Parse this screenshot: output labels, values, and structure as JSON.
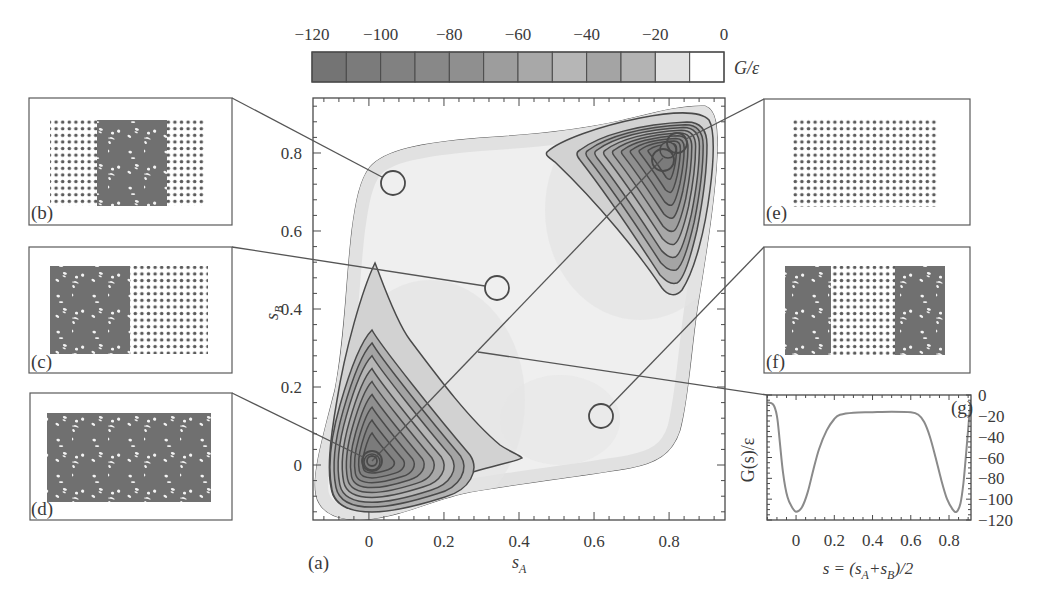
{
  "figure": {
    "panel_a_label": "(a)",
    "main_xlabel": {
      "base": "s",
      "sub": "A"
    },
    "main_ylabel": {
      "base": "s",
      "sub": "B"
    },
    "colorbar_label": "G/ε",
    "insets": [
      {
        "id": "b",
        "label": "(b)",
        "pattern": "crystal-with-disordered-center"
      },
      {
        "id": "c",
        "label": "(c)",
        "pattern": "disordered-left-crystal-right"
      },
      {
        "id": "d",
        "label": "(d)",
        "pattern": "fully-disordered"
      },
      {
        "id": "e",
        "label": "(e)",
        "pattern": "fully-crystalline"
      },
      {
        "id": "f",
        "label": "(f)",
        "pattern": "disordered-crystal-disordered"
      }
    ],
    "g_label": "(g)",
    "g_ylabel": "G(s)/ε",
    "g_xlabel_parts": [
      {
        "t": "s = (s"
      },
      {
        "t": "A",
        "sub": true
      },
      {
        "t": "+s"
      },
      {
        "t": "B",
        "sub": true
      },
      {
        "t": ")/2"
      }
    ]
  },
  "chart_data": [
    {
      "type": "heatmap",
      "subtype": "contour",
      "panel": "(a)",
      "title": "",
      "xlabel": "s_A",
      "ylabel": "s_B",
      "xlim": [
        -0.149,
        0.949
      ],
      "ylim": [
        -0.141,
        0.941
      ],
      "xticks": [
        0,
        0.2,
        0.4,
        0.6,
        0.8
      ],
      "xtick_labels": [
        "0",
        "0.2",
        "0.4",
        "0.6",
        "0.8"
      ],
      "yticks": [
        0,
        0.2,
        0.4,
        0.6,
        0.8
      ],
      "ytick_labels": [
        "0",
        "0.2",
        "0.4",
        "0.6",
        "0.8"
      ],
      "minor_tick_step": 0.04,
      "grid": false,
      "contour_levels": [
        -10,
        -20,
        -30,
        -40,
        -50,
        -60,
        -70,
        -80,
        -90,
        -100,
        -110
      ],
      "minima": [
        {
          "s_A": 0.0,
          "s_B": 0.0,
          "G": -115
        },
        {
          "s_A": 0.8,
          "s_B": 0.8,
          "G": -115
        }
      ],
      "markers": [
        {
          "inset": "(b)",
          "s_A": 0.06,
          "s_B": 0.72
        },
        {
          "inset": "(c)",
          "s_A": 0.34,
          "s_B": 0.45
        },
        {
          "inset": "(d)",
          "s_A": 0.01,
          "s_B": 0.01
        },
        {
          "inset": "(e)",
          "s_A": 0.82,
          "s_B": 0.83
        },
        {
          "inset": "(e)",
          "s_A": 0.78,
          "s_B": 0.78
        },
        {
          "inset": "(f)",
          "s_A": 0.62,
          "s_B": 0.13
        }
      ],
      "path_line": {
        "inset": "(g)",
        "from": [
          0.0,
          0.0
        ],
        "to": [
          0.78,
          0.78
        ]
      },
      "colorbar": {
        "label": "G/ε",
        "range": [
          -120,
          0
        ],
        "step": 10,
        "ticks": [
          -120,
          -100,
          -80,
          -60,
          -40,
          -20,
          0
        ],
        "tick_labels": [
          "−120",
          "−100",
          "−80",
          "−60",
          "−40",
          "−20",
          "0"
        ],
        "colors": [
          "#747474",
          "#7b7b7b",
          "#818181",
          "#888888",
          "#8f8f8f",
          "#9d9d9d",
          "#a8a8a8",
          "#b6b6b6",
          "#a4a4a4",
          "#b3b3b3",
          "#e2e2e2",
          "#ffffff"
        ]
      }
    },
    {
      "type": "line",
      "panel": "(g)",
      "title": "",
      "xlabel": "s = (s_A+s_B)/2",
      "ylabel": "G(s)/ε",
      "xlim": [
        -0.152,
        0.915
      ],
      "ylim": [
        -120,
        0
      ],
      "xticks": [
        0,
        0.2,
        0.4,
        0.6,
        0.8
      ],
      "xtick_labels": [
        "0",
        "0.2",
        "0.4",
        "0.6",
        "0.8"
      ],
      "yticks": [
        0,
        -20,
        -40,
        -60,
        -80,
        -100,
        -120
      ],
      "ytick_labels": [
        "0",
        "−20",
        "−40",
        "−60",
        "−80",
        "−100",
        "−120"
      ],
      "grid": false,
      "series": [
        {
          "name": "G(s)",
          "x": [
            -0.15,
            -0.12,
            -0.1,
            -0.085,
            -0.068,
            -0.045,
            -0.02,
            0,
            0.03,
            0.06,
            0.09,
            0.12,
            0.16,
            0.2,
            0.23,
            0.3,
            0.4,
            0.5,
            0.6,
            0.64,
            0.67,
            0.7,
            0.73,
            0.76,
            0.79,
            0.82,
            0.84,
            0.86,
            0.875,
            0.89,
            0.905,
            0.915
          ],
          "values": [
            -7,
            -9,
            -20,
            -45,
            -75,
            -98,
            -108,
            -112,
            -108,
            -94,
            -72,
            -52,
            -34,
            -23,
            -19,
            -17,
            -16.5,
            -16,
            -16.5,
            -19,
            -26,
            -40,
            -60,
            -82,
            -100,
            -110,
            -112,
            -104,
            -85,
            -55,
            -22,
            -5
          ]
        }
      ]
    }
  ]
}
